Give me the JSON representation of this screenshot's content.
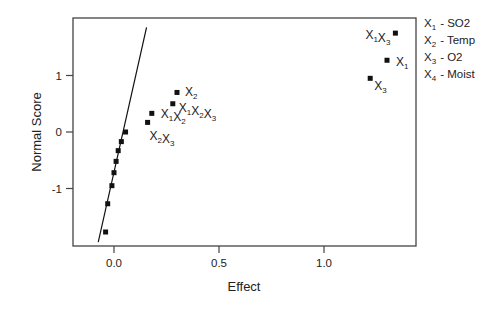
{
  "chart_data": {
    "type": "scatter",
    "title": "",
    "xlabel": "Effect",
    "ylabel": "Normal Score",
    "xlim": [
      -0.2,
      1.45
    ],
    "ylim": [
      -1.95,
      1.95
    ],
    "x_ticks": [
      {
        "value": 0.0,
        "label": "0.0"
      },
      {
        "value": 0.5,
        "label": "0.5"
      },
      {
        "value": 1.0,
        "label": "1.0"
      }
    ],
    "y_ticks": [
      {
        "value": -1,
        "label": "-1"
      },
      {
        "value": 0,
        "label": "0"
      },
      {
        "value": 1,
        "label": "1"
      }
    ],
    "grid": false,
    "reference_line": {
      "x1": -0.075,
      "y1": -1.95,
      "x2": 0.155,
      "y2": 1.85
    },
    "points": [
      {
        "x": -0.04,
        "y": -1.77,
        "label": ""
      },
      {
        "x": -0.03,
        "y": -1.27,
        "label": ""
      },
      {
        "x": -0.01,
        "y": -0.95,
        "label": ""
      },
      {
        "x": 0.0,
        "y": -0.72,
        "label": ""
      },
      {
        "x": 0.01,
        "y": -0.52,
        "label": ""
      },
      {
        "x": 0.02,
        "y": -0.33,
        "label": ""
      },
      {
        "x": 0.035,
        "y": -0.17,
        "label": ""
      },
      {
        "x": 0.055,
        "y": 0.0,
        "label": ""
      },
      {
        "x": 0.16,
        "y": 0.17,
        "label": "X2X3",
        "parts": [
          [
            "X",
            "2"
          ],
          [
            "X",
            "3"
          ]
        ],
        "label_dx": 2,
        "label_dy": 18
      },
      {
        "x": 0.18,
        "y": 0.33,
        "label": "X1X2",
        "parts": [
          [
            "X",
            "1"
          ],
          [
            "X",
            "2"
          ]
        ],
        "label_dx": 9,
        "label_dy": 5
      },
      {
        "x": 0.28,
        "y": 0.5,
        "label": "X1X2X3",
        "parts": [
          [
            "X",
            "1"
          ],
          [
            "X",
            "2"
          ],
          [
            "X",
            "3"
          ]
        ],
        "label_dx": 6,
        "label_dy": 8
      },
      {
        "x": 0.3,
        "y": 0.7,
        "label": "X2",
        "parts": [
          [
            "X",
            "2"
          ]
        ],
        "label_dx": 8,
        "label_dy": 4
      },
      {
        "x": 1.22,
        "y": 0.95,
        "label": "X3",
        "parts": [
          [
            "X",
            "3"
          ]
        ],
        "label_dx": 4,
        "label_dy": 12
      },
      {
        "x": 1.3,
        "y": 1.27,
        "label": "X1",
        "parts": [
          [
            "X",
            "1"
          ]
        ],
        "label_dx": 9,
        "label_dy": 6
      },
      {
        "x": 1.34,
        "y": 1.75,
        "label": "X1X3",
        "parts": [
          [
            "X",
            "1"
          ],
          [
            "X",
            "3"
          ]
        ],
        "label_dx": -30,
        "label_dy": 6
      }
    ],
    "legend": {
      "position": "right",
      "entries": [
        {
          "symbol": "X",
          "sub": "1",
          "text": "-  SO2"
        },
        {
          "symbol": "X",
          "sub": "2",
          "text": "-  Temp"
        },
        {
          "symbol": "X",
          "sub": "3",
          "text": "-  O2"
        },
        {
          "symbol": "X",
          "sub": "4",
          "text": "-  Moist"
        }
      ]
    }
  }
}
